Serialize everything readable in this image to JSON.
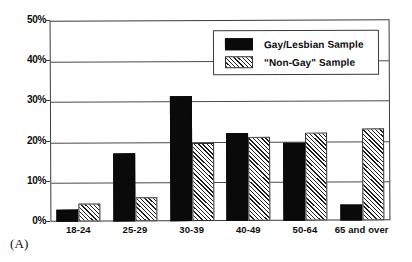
{
  "panel_label": "(A)",
  "legend": {
    "entries": [
      {
        "label": "Gay/Lesbian Sample",
        "swatch": "solid-black-swatch"
      },
      {
        "label": "\"Non-Gay\" Sample",
        "swatch": "diagonal-hatch-swatch"
      }
    ]
  },
  "axis": {
    "y_ticks": [
      "0%",
      "10%",
      "20%",
      "30%",
      "40%",
      "50%"
    ],
    "x_ticks": [
      "18-24",
      "25-29",
      "30-39",
      "40-49",
      "50-64",
      "65 and over"
    ]
  },
  "chart_data": {
    "type": "bar",
    "title": "",
    "subtitle": "",
    "xlabel": "",
    "ylabel": "",
    "ylim": [
      0,
      50
    ],
    "ytick_values": [
      0,
      10,
      20,
      30,
      40,
      50
    ],
    "ytick_labels": [
      "0%",
      "10%",
      "20%",
      "30%",
      "40%",
      "50%"
    ],
    "grid": true,
    "grid_axis": "y",
    "legend_position": "top-right-inside",
    "categories": [
      "18-24",
      "25-29",
      "30-39",
      "40-49",
      "50-64",
      "65 and over"
    ],
    "series": [
      {
        "name": "Gay/Lesbian Sample",
        "color": "#0a0a0a",
        "fill": "solid",
        "values": [
          3,
          17,
          31,
          22,
          19.5,
          4
        ]
      },
      {
        "name": "\"Non-Gay\" Sample",
        "color": "#ffffff",
        "fill": "diagonal-hatch",
        "values": [
          4.5,
          6,
          19.5,
          21,
          22,
          23
        ]
      }
    ],
    "annotations": [
      "(A)"
    ]
  },
  "colors": {
    "series_solid": "#0a0a0a",
    "series_hatch_line": "#1f1f1f",
    "frame": "#3a3a3a",
    "gridline": "#4a4a4a",
    "background": "#ffffff"
  }
}
